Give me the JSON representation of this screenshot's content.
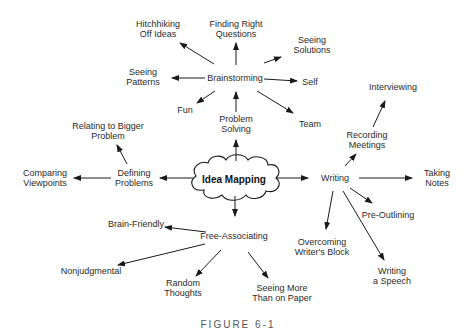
{
  "figure": {
    "caption": "FIGURE 6-1",
    "center": {
      "id": "idea-mapping",
      "label": "Idea Mapping",
      "x": 234,
      "y": 179
    },
    "nodes": [
      {
        "id": "problem-solving",
        "label": "Problem\nSolving",
        "x": 236,
        "y": 124
      },
      {
        "id": "brainstorming",
        "label": "Brainstorming",
        "x": 235,
        "y": 78
      },
      {
        "id": "hitchhiking",
        "label": "Hitchhiking\nOff Ideas",
        "x": 158,
        "y": 29
      },
      {
        "id": "finding-right-questions",
        "label": "Finding Right\nQuestions",
        "x": 236,
        "y": 29
      },
      {
        "id": "seeing-solutions",
        "label": "Seeing\nSolutions",
        "x": 312,
        "y": 45
      },
      {
        "id": "seeing-patterns",
        "label": "Seeing\nPatterns",
        "x": 143,
        "y": 77
      },
      {
        "id": "self",
        "label": "Self",
        "x": 310,
        "y": 82
      },
      {
        "id": "fun",
        "label": "Fun",
        "x": 185,
        "y": 110
      },
      {
        "id": "team",
        "label": "Team",
        "x": 310,
        "y": 124
      },
      {
        "id": "writing",
        "label": "Writing",
        "x": 335,
        "y": 178
      },
      {
        "id": "recording-meetings",
        "label": "Recording\nMeetings",
        "x": 367,
        "y": 140
      },
      {
        "id": "interviewing",
        "label": "Interviewing",
        "x": 393,
        "y": 87
      },
      {
        "id": "taking-notes",
        "label": "Taking\nNotes",
        "x": 437,
        "y": 178
      },
      {
        "id": "pre-outlining",
        "label": "Pre-Outlining",
        "x": 388,
        "y": 215
      },
      {
        "id": "overcoming-writers-block",
        "label": "Overcoming\nWriter's Block",
        "x": 322,
        "y": 247
      },
      {
        "id": "writing-a-speech",
        "label": "Writing\na Speech",
        "x": 392,
        "y": 276
      },
      {
        "id": "free-associating",
        "label": "Free-Associating",
        "x": 234,
        "y": 236
      },
      {
        "id": "brain-friendly",
        "label": "Brain-Friendly",
        "x": 136,
        "y": 224
      },
      {
        "id": "nonjudgmental",
        "label": "Nonjudgmental",
        "x": 91,
        "y": 271
      },
      {
        "id": "random-thoughts",
        "label": "Random\nThoughts",
        "x": 183,
        "y": 288
      },
      {
        "id": "seeing-more-than-on-paper",
        "label": "Seeing More\nThan on Paper",
        "x": 282,
        "y": 293
      },
      {
        "id": "defining-problems",
        "label": "Defining\nProblems",
        "x": 134,
        "y": 178
      },
      {
        "id": "comparing-viewpoints",
        "label": "Comparing\nViewpoints",
        "x": 45,
        "y": 178
      },
      {
        "id": "relating-to-bigger-problem",
        "label": "Relating to Bigger\nProblem",
        "x": 108,
        "y": 131
      }
    ],
    "edges": [
      {
        "from": "idea-mapping",
        "to": "problem-solving",
        "x1": 236,
        "y1": 161,
        "x2": 236,
        "y2": 140
      },
      {
        "from": "problem-solving",
        "to": "brainstorming",
        "x1": 236,
        "y1": 112,
        "x2": 236,
        "y2": 92
      },
      {
        "from": "brainstorming",
        "to": "finding-right-questions",
        "x1": 236,
        "y1": 65,
        "x2": 236,
        "y2": 43
      },
      {
        "from": "brainstorming",
        "to": "hitchhiking",
        "x1": 214,
        "y1": 64,
        "x2": 180,
        "y2": 43
      },
      {
        "from": "brainstorming",
        "to": "seeing-patterns",
        "x1": 205,
        "y1": 78,
        "x2": 172,
        "y2": 78
      },
      {
        "from": "brainstorming",
        "to": "fun",
        "x1": 215,
        "y1": 91,
        "x2": 197,
        "y2": 103
      },
      {
        "from": "brainstorming",
        "to": "seeing-solutions",
        "x1": 264,
        "y1": 63,
        "x2": 281,
        "y2": 57
      },
      {
        "from": "brainstorming",
        "to": "self",
        "x1": 264,
        "y1": 79,
        "x2": 297,
        "y2": 81
      },
      {
        "from": "brainstorming",
        "to": "team",
        "x1": 257,
        "y1": 91,
        "x2": 293,
        "y2": 113
      },
      {
        "from": "idea-mapping",
        "to": "writing",
        "x1": 277,
        "y1": 178,
        "x2": 308,
        "y2": 178
      },
      {
        "from": "writing",
        "to": "recording-meetings",
        "x1": 345,
        "y1": 166,
        "x2": 356,
        "y2": 154
      },
      {
        "from": "recording-meetings",
        "to": "interviewing",
        "x1": 373,
        "y1": 127,
        "x2": 385,
        "y2": 101
      },
      {
        "from": "writing",
        "to": "taking-notes",
        "x1": 359,
        "y1": 178,
        "x2": 412,
        "y2": 178
      },
      {
        "from": "writing",
        "to": "pre-outlining",
        "x1": 350,
        "y1": 188,
        "x2": 372,
        "y2": 203
      },
      {
        "from": "writing",
        "to": "overcoming-writers-block",
        "x1": 333,
        "y1": 191,
        "x2": 326,
        "y2": 229
      },
      {
        "from": "writing",
        "to": "writing-a-speech",
        "x1": 343,
        "y1": 191,
        "x2": 384,
        "y2": 260
      },
      {
        "from": "idea-mapping",
        "to": "free-associating",
        "x1": 235,
        "y1": 196,
        "x2": 235,
        "y2": 216
      },
      {
        "from": "free-associating",
        "to": "brain-friendly",
        "x1": 206,
        "y1": 232,
        "x2": 165,
        "y2": 227
      },
      {
        "from": "free-associating",
        "to": "nonjudgmental",
        "x1": 205,
        "y1": 244,
        "x2": 118,
        "y2": 265
      },
      {
        "from": "free-associating",
        "to": "random-thoughts",
        "x1": 221,
        "y1": 250,
        "x2": 196,
        "y2": 276
      },
      {
        "from": "free-associating",
        "to": "seeing-more-than-on-paper",
        "x1": 248,
        "y1": 252,
        "x2": 268,
        "y2": 278
      },
      {
        "from": "idea-mapping",
        "to": "defining-problems",
        "x1": 193,
        "y1": 178,
        "x2": 160,
        "y2": 178
      },
      {
        "from": "defining-problems",
        "to": "comparing-viewpoints",
        "x1": 111,
        "y1": 178,
        "x2": 74,
        "y2": 178
      },
      {
        "from": "defining-problems",
        "to": "relating-to-bigger-problem",
        "x1": 127,
        "y1": 164,
        "x2": 117,
        "y2": 145
      }
    ]
  }
}
